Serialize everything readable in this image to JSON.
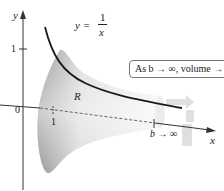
{
  "figure": {
    "axes": {
      "y_label": "y",
      "x_label": "x",
      "origin_label": "0",
      "y_tick_1": "1",
      "x_tick_1": "1",
      "x_tick_b": "b → ∞"
    },
    "curve": {
      "eq_lhs": "y =",
      "eq_num": "1",
      "eq_den": "x"
    },
    "region_label": "R",
    "callout": "As b → ∞, volume → π",
    "colors": {
      "curve": "#1a1a1a",
      "solid_dark": "#9a9a9a",
      "solid_light": "#f2f2f2",
      "axis": "#333333",
      "rotation_arrow": "#d8d8d8"
    }
  }
}
